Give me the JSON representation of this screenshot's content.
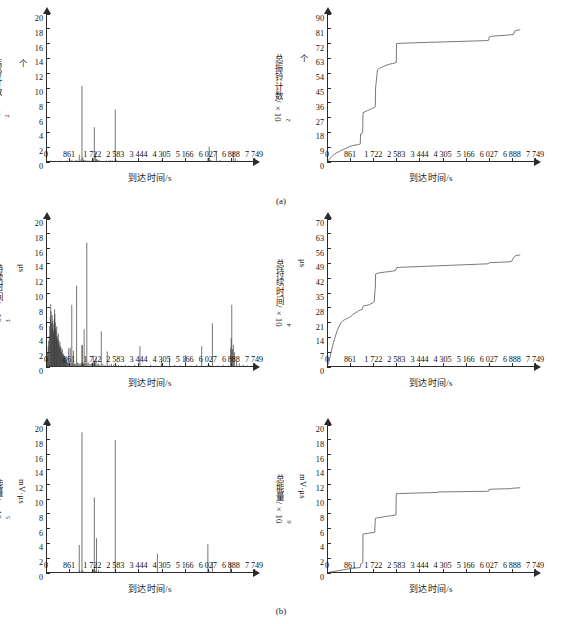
{
  "figure": {
    "xlabel": "到达时间/s",
    "xticks": [
      "0",
      "861",
      "1 722",
      "2 583",
      "3 444",
      "4 305",
      "5 166",
      "6 027",
      "6 888",
      "7 749"
    ],
    "xtick_values": [
      0,
      861,
      1722,
      2583,
      3444,
      4305,
      5166,
      6027,
      6888,
      7749
    ],
    "xlim": [
      0,
      7749
    ],
    "captions": [
      "(a)",
      "(b)",
      "(c)"
    ],
    "line_color": "#555555",
    "stem_color": "#3a3a3a"
  },
  "chart_data": [
    {
      "id": "ring-count-rate",
      "panel": "a-left",
      "type": "bar",
      "title": "",
      "xlabel": "到达时间/s",
      "ylabel": "振铃计数/×10²个",
      "ylabel_base": "振铃计数/×10",
      "ylabel_exp": "2",
      "ylabel_tail": "个",
      "xlim": [
        0,
        7749
      ],
      "ylim": [
        0,
        20
      ],
      "yticks": [
        0,
        2,
        4,
        6,
        8,
        10,
        12,
        14,
        16,
        18,
        20
      ],
      "ytick_labels": [
        "0",
        "2",
        "4",
        "6",
        "8",
        "10",
        "12",
        "14",
        "16",
        "18",
        "20"
      ],
      "grid": false,
      "legend": "none",
      "x": [
        60,
        120,
        180,
        240,
        300,
        360,
        430,
        500,
        560,
        640,
        700,
        780,
        860,
        930,
        990,
        1050,
        1110,
        1180,
        1240,
        1300,
        1340,
        1370,
        1400,
        1430,
        1470,
        1520,
        1560,
        1610,
        1660,
        1700,
        1760,
        1800,
        1850,
        1880,
        1910,
        1950,
        2000,
        2060,
        2120,
        2180,
        2250,
        2320,
        2400,
        2470,
        2530,
        2580,
        2600,
        2640,
        2700,
        2760,
        2830,
        2900,
        3000,
        3100,
        3200,
        3320,
        3450,
        3600,
        3750,
        3900,
        4050,
        4200,
        4320,
        4450,
        4600,
        4750,
        4900,
        5050,
        5200,
        5350,
        5500,
        5650,
        5800,
        5950,
        6030,
        6080,
        6130,
        6180,
        6250,
        6350,
        6480,
        6600,
        6750,
        6880,
        6930,
        6980,
        7050,
        7150,
        7280,
        7400,
        7550,
        7700
      ],
      "values": [
        0.15,
        0.1,
        0.2,
        0.12,
        0.08,
        0.15,
        0.1,
        0.18,
        0.12,
        0.1,
        0.15,
        0.2,
        0.12,
        0.3,
        0.18,
        0.15,
        0.25,
        0.2,
        1.0,
        0.35,
        10.3,
        0.6,
        0.3,
        0.2,
        0.25,
        0.15,
        0.2,
        0.18,
        0.12,
        0.2,
        0.5,
        4.7,
        1.3,
        0.4,
        0.3,
        0.25,
        0.2,
        0.15,
        0.12,
        0.15,
        0.2,
        0.18,
        0.25,
        0.2,
        0.15,
        7.1,
        0.3,
        0.2,
        0.15,
        0.12,
        0.1,
        0.15,
        0.12,
        0.1,
        0.15,
        0.12,
        0.1,
        0.12,
        0.1,
        0.15,
        0.12,
        0.1,
        0.3,
        0.12,
        0.1,
        0.08,
        0.12,
        0.1,
        0.08,
        0.1,
        0.12,
        0.1,
        0.08,
        0.1,
        0.5,
        2.1,
        0.3,
        0.2,
        0.15,
        1.5,
        0.25,
        0.15,
        0.12,
        0.1,
        0.08,
        1.35,
        0.5,
        0.2,
        0.12,
        0.1,
        0.08,
        0.1
      ]
    },
    {
      "id": "ring-count-cumulative",
      "panel": "a-right",
      "type": "line",
      "title": "",
      "xlabel": "到达时间/s",
      "ylabel": "总振铃计数/×10²个",
      "ylabel_base": "总振铃计数/×10",
      "ylabel_exp": "2",
      "ylabel_tail": "个",
      "xlim": [
        0,
        7749
      ],
      "ylim": [
        0,
        90
      ],
      "yticks": [
        0,
        9,
        18,
        27,
        36,
        45,
        54,
        63,
        72,
        81,
        90
      ],
      "ytick_labels": [
        "0",
        "9",
        "18",
        "27",
        "36",
        "45",
        "54",
        "63",
        "72",
        "81",
        "90"
      ],
      "grid": false,
      "legend": "none",
      "x": [
        0,
        80,
        170,
        260,
        360,
        460,
        560,
        660,
        760,
        860,
        960,
        1050,
        1130,
        1180,
        1240,
        1250,
        1320,
        1330,
        1340,
        1345,
        1420,
        1500,
        1580,
        1660,
        1740,
        1790,
        1800,
        1810,
        1880,
        1960,
        2040,
        2120,
        2200,
        2280,
        2360,
        2440,
        2520,
        2580,
        2590,
        2640,
        2750,
        2900,
        3100,
        3300,
        3500,
        3700,
        3900,
        4100,
        4300,
        4500,
        4700,
        4900,
        5100,
        5300,
        5500,
        5700,
        5900,
        6020,
        6050,
        6100,
        6200,
        6400,
        6600,
        6800,
        6950,
        7000,
        7050,
        7120,
        7180,
        7200
      ],
      "values": [
        0,
        1.5,
        3.2,
        4.5,
        5.6,
        6.4,
        7.3,
        8.0,
        8.8,
        9.5,
        10.0,
        10.3,
        10.5,
        10.6,
        11.0,
        17.0,
        17.6,
        18.0,
        28.0,
        30.0,
        30.6,
        31.2,
        31.8,
        32.4,
        33.0,
        33.4,
        34.5,
        45.0,
        56.0,
        57.0,
        57.6,
        58.2,
        58.8,
        59.2,
        59.6,
        59.9,
        60.2,
        60.5,
        72.0,
        72.1,
        72.2,
        72.3,
        72.4,
        72.5,
        72.6,
        72.7,
        72.8,
        72.9,
        73.0,
        73.1,
        73.2,
        73.3,
        73.4,
        73.5,
        73.6,
        73.7,
        73.8,
        74.0,
        76.2,
        76.4,
        76.6,
        76.8,
        77.0,
        77.3,
        77.6,
        79.8,
        80.0,
        80.2,
        80.4,
        80.5
      ]
    },
    {
      "id": "duration-rate",
      "panel": "b-left",
      "type": "bar",
      "title": "",
      "xlabel": "到达时间/s",
      "ylabel": "持续时间/×10³ μs",
      "ylabel_base": "持续时间/×10",
      "ylabel_exp": "3",
      "ylabel_tail": " μs",
      "xlim": [
        0,
        7749
      ],
      "ylim": [
        0,
        20
      ],
      "yticks": [
        0,
        2,
        4,
        6,
        8,
        10,
        12,
        14,
        16,
        18,
        20
      ],
      "ytick_labels": [
        "0",
        "2",
        "4",
        "6",
        "8",
        "10",
        "12",
        "14",
        "16",
        "18",
        "20"
      ],
      "grid": false,
      "legend": "none",
      "x": [
        30,
        55,
        80,
        100,
        120,
        140,
        160,
        175,
        190,
        205,
        220,
        235,
        250,
        265,
        280,
        295,
        310,
        320,
        330,
        345,
        360,
        375,
        390,
        400,
        415,
        430,
        445,
        460,
        475,
        490,
        505,
        520,
        535,
        550,
        565,
        580,
        595,
        610,
        625,
        640,
        655,
        670,
        685,
        700,
        715,
        730,
        745,
        760,
        780,
        800,
        820,
        845,
        870,
        900,
        930,
        960,
        990,
        1020,
        1060,
        1100,
        1140,
        1180,
        1220,
        1260,
        1300,
        1340,
        1345,
        1350,
        1360,
        1380,
        1400,
        1420,
        1450,
        1480,
        1520,
        1560,
        1600,
        1650,
        1700,
        1760,
        1790,
        1800,
        1810,
        1830,
        1860,
        1900,
        1950,
        2000,
        2060,
        2120,
        2200,
        2280,
        2360,
        2440,
        2520,
        2580,
        2620,
        2700,
        2800,
        2950,
        3100,
        3300,
        3500,
        3700,
        3900,
        4100,
        4300,
        4320,
        4400,
        4600,
        4800,
        5000,
        5200,
        5400,
        5600,
        5800,
        6020,
        6100,
        6200,
        6400,
        6600,
        6800,
        6880,
        6900,
        6920,
        6950,
        6980,
        7020,
        7100,
        7200,
        7350,
        7500,
        7650
      ],
      "values": [
        1.2,
        2.0,
        2.8,
        3.5,
        4.2,
        5.5,
        6.8,
        8.5,
        7.5,
        6.0,
        5.2,
        7.0,
        6.2,
        5.0,
        4.5,
        5.8,
        6.5,
        7.8,
        7.2,
        6.0,
        5.2,
        4.8,
        4.0,
        5.5,
        4.2,
        3.8,
        3.2,
        4.5,
        3.6,
        3.0,
        2.6,
        3.4,
        2.8,
        2.2,
        2.6,
        2.0,
        1.8,
        2.4,
        1.6,
        1.4,
        1.8,
        1.2,
        1.5,
        1.0,
        1.3,
        0.9,
        1.1,
        0.8,
        0.7,
        0.6,
        0.5,
        2.5,
        0.6,
        2.6,
        0.5,
        8.4,
        0.6,
        2.2,
        0.5,
        0.4,
        11.0,
        0.6,
        0.5,
        0.4,
        0.5,
        3.0,
        0.6,
        2.9,
        0.5,
        0.6,
        0.4,
        5.1,
        0.5,
        0.6,
        16.8,
        0.5,
        0.6,
        0.4,
        0.5,
        1.5,
        0.4,
        0.8,
        0.6,
        0.5,
        1.2,
        0.4,
        0.5,
        0.3,
        4.8,
        0.4,
        0.3,
        2.1,
        0.3,
        0.4,
        0.3,
        0.5,
        0.2,
        0.3,
        0.2,
        0.3,
        0.2,
        0.3,
        2.8,
        0.2,
        0.3,
        0.2,
        0.8,
        0.3,
        0.2,
        1.3,
        0.3,
        0.2,
        1.6,
        0.2,
        0.3,
        2.8,
        0.2,
        0.3,
        5.9,
        0.2,
        0.3,
        0.2,
        2.6,
        3.9,
        8.4,
        2.4,
        3.0,
        2.0,
        0.8,
        0.5,
        0.3,
        0.2,
        0.15,
        0.1
      ]
    },
    {
      "id": "duration-cumulative",
      "panel": "b-right",
      "type": "line",
      "title": "",
      "xlabel": "到达时间/s",
      "ylabel": "总持续时间/×10⁴ μs",
      "ylabel_base": "总持续时间/×10",
      "ylabel_exp": "4",
      "ylabel_tail": " μs",
      "xlim": [
        0,
        7749
      ],
      "ylim": [
        0,
        70
      ],
      "yticks": [
        0,
        7,
        14,
        21,
        28,
        35,
        42,
        49,
        56,
        63,
        70
      ],
      "ytick_labels": [
        "0",
        "7",
        "14",
        "21",
        "28",
        "35",
        "42",
        "49",
        "56",
        "63",
        "70"
      ],
      "grid": false,
      "legend": "none",
      "x": [
        0,
        60,
        120,
        180,
        240,
        300,
        360,
        420,
        480,
        540,
        600,
        660,
        720,
        780,
        840,
        900,
        980,
        1060,
        1140,
        1180,
        1250,
        1320,
        1340,
        1345,
        1400,
        1480,
        1560,
        1600,
        1640,
        1700,
        1740,
        1760,
        1790,
        1800,
        1810,
        1870,
        1950,
        2050,
        2150,
        2250,
        2350,
        2450,
        2550,
        2600,
        2650,
        2800,
        3000,
        3200,
        3400,
        3600,
        3800,
        4000,
        4200,
        4400,
        4600,
        4800,
        5000,
        5200,
        5400,
        5600,
        5800,
        6000,
        6050,
        6150,
        6350,
        6550,
        6750,
        6880,
        6920,
        6970,
        7020,
        7100,
        7200
      ],
      "values": [
        0,
        2.0,
        5.0,
        8.5,
        11.5,
        14.0,
        16.5,
        18.5,
        20.0,
        21.2,
        22.0,
        22.4,
        22.8,
        23.1,
        23.5,
        24.0,
        25.0,
        25.6,
        26.2,
        26.6,
        27.0,
        27.4,
        28.5,
        28.8,
        29.0,
        29.2,
        29.4,
        29.6,
        30.0,
        30.3,
        30.6,
        31.0,
        36.5,
        37.0,
        44.0,
        44.3,
        44.5,
        44.7,
        44.9,
        45.0,
        45.2,
        45.4,
        45.6,
        47.0,
        47.1,
        47.2,
        47.3,
        47.4,
        47.5,
        47.6,
        47.7,
        47.8,
        47.9,
        48.0,
        48.1,
        48.2,
        48.3,
        48.4,
        48.5,
        48.6,
        48.7,
        48.8,
        49.3,
        49.4,
        49.5,
        49.6,
        49.7,
        50.0,
        51.0,
        52.0,
        52.6,
        52.8,
        53.0
      ]
    },
    {
      "id": "energy-rate",
      "panel": "c-left",
      "type": "bar",
      "title": "",
      "xlabel": "到达时间/s",
      "ylabel": "能量/×10⁵ mV·μs",
      "ylabel_base": "能量/×10",
      "ylabel_exp": "5",
      "ylabel_tail": " mV·μs",
      "xlim": [
        0,
        7749
      ],
      "ylim": [
        0,
        20
      ],
      "yticks": [
        0,
        2,
        4,
        6,
        8,
        10,
        12,
        14,
        16,
        18,
        20
      ],
      "ytick_labels": [
        "0",
        "2",
        "4",
        "6",
        "8",
        "10",
        "12",
        "14",
        "16",
        "18",
        "20"
      ],
      "grid": false,
      "legend": "none",
      "x": [
        60,
        150,
        250,
        350,
        450,
        560,
        660,
        760,
        860,
        960,
        1050,
        1150,
        1240,
        1250,
        1300,
        1340,
        1345,
        1400,
        1480,
        1560,
        1660,
        1760,
        1790,
        1800,
        1810,
        1830,
        1880,
        1950,
        2050,
        2150,
        2280,
        2400,
        2520,
        2580,
        2590,
        2650,
        2800,
        3000,
        3200,
        3400,
        3600,
        3800,
        4000,
        4150,
        4200,
        4400,
        4600,
        4800,
        5000,
        5200,
        5400,
        5600,
        5800,
        6020,
        6030,
        6100,
        6200,
        6350,
        6500,
        6700,
        6880,
        6900,
        7000,
        7150,
        7300,
        7500,
        7700
      ],
      "values": [
        0.1,
        0.12,
        0.1,
        0.08,
        0.1,
        0.12,
        0.1,
        0.15,
        0.12,
        0.1,
        0.15,
        0.12,
        3.8,
        0.3,
        0.15,
        19.0,
        0.4,
        0.2,
        0.15,
        0.12,
        0.1,
        0.5,
        0.3,
        10.2,
        0.5,
        0.3,
        4.7,
        0.4,
        0.2,
        0.15,
        0.12,
        0.1,
        0.15,
        18.0,
        0.2,
        0.15,
        0.12,
        0.1,
        0.08,
        0.1,
        0.12,
        0.1,
        0.08,
        2.6,
        0.15,
        0.1,
        0.08,
        0.1,
        0.08,
        0.1,
        0.08,
        0.1,
        0.08,
        0.15,
        3.9,
        0.2,
        1.5,
        0.15,
        0.1,
        0.08,
        1.4,
        0.2,
        0.1,
        0.08,
        0.1,
        0.08,
        0.1
      ]
    },
    {
      "id": "energy-cumulative",
      "panel": "c-right",
      "type": "line",
      "title": "",
      "xlabel": "到达时间/s",
      "ylabel": "总能量/×10⁶ mV·μs",
      "ylabel_base": "总能量/×10",
      "ylabel_exp": "6",
      "ylabel_tail": " mV·μs",
      "xlim": [
        0,
        7749
      ],
      "ylim": [
        0,
        20
      ],
      "yticks": [
        0,
        2,
        4,
        6,
        8,
        10,
        12,
        14,
        16,
        18,
        20
      ],
      "ytick_labels": [
        "0",
        "2",
        "4",
        "6",
        "8",
        "10",
        "12",
        "14",
        "16",
        "18",
        "20"
      ],
      "grid": false,
      "legend": "none",
      "x": [
        0,
        100,
        250,
        400,
        560,
        720,
        860,
        1000,
        1140,
        1240,
        1250,
        1300,
        1335,
        1340,
        1345,
        1420,
        1500,
        1600,
        1700,
        1780,
        1790,
        1800,
        1810,
        1880,
        1960,
        2040,
        2120,
        2200,
        2300,
        2400,
        2500,
        2570,
        2580,
        2590,
        2700,
        2900,
        3100,
        3300,
        3500,
        3700,
        3900,
        4100,
        4150,
        4300,
        4500,
        4700,
        4900,
        5100,
        5300,
        5500,
        5700,
        5900,
        6020,
        6040,
        6120,
        6250,
        6450,
        6650,
        6850,
        6880,
        6920,
        7000,
        7120,
        7200
      ],
      "values": [
        0,
        0.1,
        0.2,
        0.3,
        0.4,
        0.5,
        0.6,
        0.65,
        0.7,
        0.75,
        1.2,
        1.3,
        1.4,
        5.2,
        5.25,
        5.3,
        5.35,
        5.4,
        5.45,
        5.5,
        6.6,
        7.3,
        7.4,
        7.45,
        7.5,
        7.55,
        7.6,
        7.65,
        7.7,
        7.75,
        7.8,
        7.85,
        10.7,
        10.72,
        10.74,
        10.76,
        10.78,
        10.8,
        10.82,
        10.84,
        10.86,
        10.88,
        10.95,
        10.96,
        10.97,
        10.98,
        10.99,
        11.0,
        11.01,
        11.02,
        11.03,
        11.04,
        11.05,
        11.3,
        11.32,
        11.34,
        11.36,
        11.38,
        11.4,
        11.42,
        11.45,
        11.48,
        11.5,
        11.52
      ]
    }
  ]
}
